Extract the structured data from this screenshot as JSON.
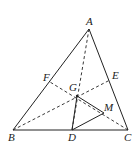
{
  "diagram": {
    "type": "geometry-triangle",
    "points": {
      "A": {
        "label": "A",
        "x": 89,
        "y": 29,
        "lx": 86,
        "ly": 25
      },
      "B": {
        "label": "B",
        "x": 13,
        "y": 130,
        "lx": 8,
        "ly": 141
      },
      "C": {
        "label": "C",
        "x": 128,
        "y": 130,
        "lx": 124,
        "ly": 141
      },
      "D": {
        "label": "D",
        "x": 72,
        "y": 130,
        "lx": 68,
        "ly": 141
      },
      "E": {
        "label": "E",
        "x": 110,
        "y": 80,
        "lx": 112,
        "ly": 79
      },
      "F": {
        "label": "F",
        "x": 50,
        "y": 82,
        "lx": 43,
        "ly": 81
      },
      "G": {
        "label": "G",
        "x": 77,
        "y": 96,
        "lx": 69,
        "ly": 91
      },
      "M": {
        "label": "M",
        "x": 104,
        "y": 113,
        "lx": 104,
        "ly": 111
      }
    },
    "solid_segments": [
      "AB",
      "AC",
      "BC",
      "GD",
      "GM",
      "DM"
    ],
    "dashed_segments": [
      "AD",
      "BE",
      "CF"
    ],
    "stroke_color": "#222222"
  }
}
